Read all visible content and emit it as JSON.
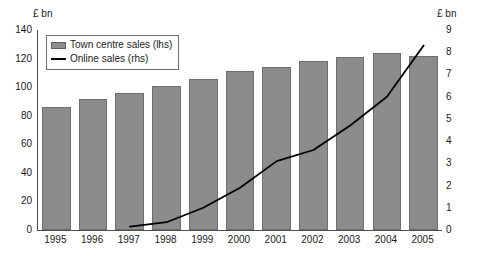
{
  "chart_data": {
    "type": "bar",
    "title": "",
    "xlabel": "",
    "ylabel": "£ bn",
    "y2label": "£ bn",
    "grid": false,
    "legend_position": "top-left",
    "categories": [
      "1995",
      "1996",
      "1997",
      "1998",
      "1999",
      "2000",
      "2001",
      "2002",
      "2003",
      "2004",
      "2005"
    ],
    "ylim": [
      0,
      140
    ],
    "y2lim": [
      0,
      9
    ],
    "yticks": [
      0,
      20,
      40,
      60,
      80,
      100,
      120,
      140
    ],
    "y2ticks": [
      0,
      1,
      2,
      3,
      4,
      5,
      6,
      7,
      8,
      9
    ],
    "series": [
      {
        "name": "Town centre sales (lhs)",
        "type": "bar",
        "axis": "left",
        "color": "#8c8c8c",
        "edge_color": "#6e6e6e",
        "values": [
          86,
          92,
          96,
          101,
          106,
          111,
          114,
          118,
          121,
          124,
          122
        ]
      },
      {
        "name": "Online sales (rhs)",
        "type": "line",
        "axis": "right",
        "color": "#000000",
        "x": [
          "1997",
          "1998",
          "1999",
          "2000",
          "2001",
          "2002",
          "2003",
          "2004",
          "2005"
        ],
        "values": [
          0.15,
          0.35,
          1.0,
          1.9,
          3.1,
          3.6,
          4.7,
          6.0,
          8.3
        ]
      }
    ]
  },
  "axes": {
    "left_unit": "£ bn",
    "right_unit": "£ bn",
    "left_ticks": [
      "140",
      "120",
      "100",
      "80",
      "60",
      "40",
      "20",
      "0"
    ],
    "right_ticks": [
      "9",
      "8",
      "7",
      "6",
      "5",
      "4",
      "3",
      "2",
      "1",
      "0"
    ]
  },
  "legend": {
    "items": [
      {
        "label": "Town centre sales (lhs)",
        "marker": "bar-swatch",
        "color": "#8c8c8c"
      },
      {
        "label": "Online sales (rhs)",
        "marker": "line-swatch",
        "color": "#000000"
      }
    ]
  }
}
